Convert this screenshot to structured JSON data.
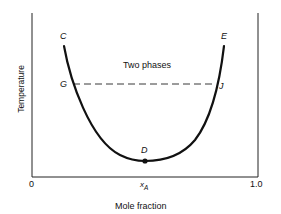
{
  "diagram": {
    "type": "phase-diagram",
    "title": "",
    "axes": {
      "y_label": "Temperature",
      "x_label": "Mole fraction",
      "x_tick_min": "0",
      "x_tick_max": "1.0",
      "x_marker": "x",
      "x_marker_sub": "A"
    },
    "region_label": "Two phases",
    "points": {
      "C": "C",
      "E": "E",
      "G": "G",
      "J": "J",
      "D": "D"
    },
    "colors": {
      "line": "#111111",
      "background": "#ffffff"
    }
  }
}
